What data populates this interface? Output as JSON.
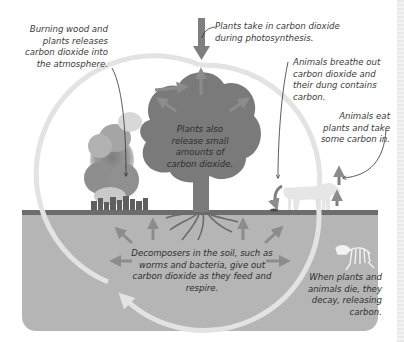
{
  "diagram": {
    "colors": {
      "background": "#ffffff",
      "soil": "#b5b5b5",
      "ground_line": "#6d6d6d",
      "tree": "#7a7a7a",
      "arrow": "#8c8c8c",
      "cycle_ring": "#e3e3e3",
      "smoke": "#9a9a9a",
      "cow": "#e6e6e6",
      "skeleton": "#f2f2f2",
      "text": "#3c3c3c"
    },
    "labels": {
      "burning": "Burning wood and plants releases carbon dioxide into the atmosphere.",
      "photosynthesis": "Plants take in carbon dioxide during photosynthesis.",
      "animals_breathe": "Animals breathe out carbon dioxide and their dung contains carbon.",
      "animals_eat": "Animals eat plants and take some carbon in.",
      "plants_release": "Plants also release small amounts of carbon dioxide.",
      "decomposers": "Decomposers in the soil, such as worms and bacteria, give out carbon dioxide as they feed and respire.",
      "decay": "When plants and animals die, they decay, releasing carbon."
    },
    "elements": {
      "icons": [
        "tree-icon",
        "smoke-icon",
        "factory-buildings-icon",
        "cow-icon",
        "animal-skeleton-icon",
        "cycle-ring-arrow",
        "co2-arrows"
      ]
    }
  }
}
